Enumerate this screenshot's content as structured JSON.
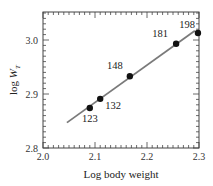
{
  "chart_data": {
    "type": "scatter",
    "title": "",
    "xlabel": "Log body weight",
    "ylabel": "log W_T",
    "ylabel_parts": {
      "prefix": "log ",
      "var": "W",
      "sub": "T"
    },
    "xlim": [
      2.0,
      2.3
    ],
    "ylim": [
      2.8,
      3.05
    ],
    "x_ticks": [
      2.0,
      2.1,
      2.2,
      2.3
    ],
    "x_tick_labels": [
      "2.0",
      "2.1",
      "2.2",
      "2.3"
    ],
    "y_ticks": [
      2.8,
      2.9,
      3.0
    ],
    "y_tick_labels": [
      "2.8",
      "2.9",
      "3.0"
    ],
    "minor_tick_step_x": 0.01,
    "minor_tick_step_y": 0.01,
    "grid": false,
    "legend": null,
    "series": [
      {
        "name": "data points",
        "points": [
          {
            "label": "123",
            "x": 2.09,
            "y": 2.874
          },
          {
            "label": "132",
            "x": 2.11,
            "y": 2.891
          },
          {
            "label": "148",
            "x": 2.167,
            "y": 2.933
          },
          {
            "label": "181",
            "x": 2.256,
            "y": 2.993
          },
          {
            "label": "198",
            "x": 2.298,
            "y": 3.013
          }
        ]
      },
      {
        "name": "regression line",
        "type": "line",
        "points": [
          {
            "x": 2.046,
            "y": 2.847
          },
          {
            "x": 2.292,
            "y": 3.017
          }
        ]
      }
    ],
    "colors": {
      "points": "#111111",
      "line": "#7a7a7a",
      "frame": "#444444"
    }
  }
}
